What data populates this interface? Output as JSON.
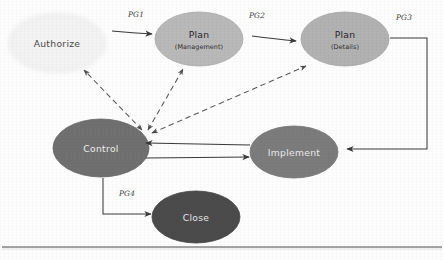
{
  "diagram": {
    "background_color": "#fdfdfd",
    "nodes": [
      {
        "id": "authorize",
        "label": "Authorize",
        "sublabel": "",
        "cx": 57,
        "cy": 43,
        "rx": 48,
        "ry": 29,
        "fill": "#f4f4f4",
        "text_color": "#4a4a4a"
      },
      {
        "id": "plan-management",
        "label": "Plan",
        "sublabel": "(Management)",
        "cx": 199,
        "cy": 39,
        "rx": 44,
        "ry": 27,
        "fill": "#b9b9b9",
        "text_color": "#2b2b2b"
      },
      {
        "id": "plan-details",
        "label": "Plan",
        "sublabel": "(Details)",
        "cx": 345,
        "cy": 39,
        "rx": 44,
        "ry": 27,
        "fill": "#b2b2b2",
        "text_color": "#2b2b2b"
      },
      {
        "id": "control",
        "label": "Control",
        "sublabel": "",
        "cx": 101,
        "cy": 148,
        "rx": 48,
        "ry": 29,
        "fill": "#6f6f6f",
        "text_color": "#f0f0f0"
      },
      {
        "id": "implement",
        "label": "Implement",
        "sublabel": "",
        "cx": 294,
        "cy": 152,
        "rx": 44,
        "ry": 26,
        "fill": "#7c7c7c",
        "text_color": "#ececec"
      },
      {
        "id": "close",
        "label": "Close",
        "sublabel": "",
        "cx": 196,
        "cy": 217,
        "rx": 44,
        "ry": 26,
        "fill": "#4b4b4b",
        "text_color": "#e8e8e8"
      }
    ],
    "edge_labels": [
      {
        "id": "pg1",
        "text": "PG1",
        "x": 136,
        "y": 17
      },
      {
        "id": "pg2",
        "text": "PG2",
        "x": 257,
        "y": 18
      },
      {
        "id": "pg3",
        "text": "PG3",
        "x": 404,
        "y": 20
      },
      {
        "id": "pg4",
        "text": "PG4",
        "x": 127,
        "y": 196
      }
    ],
    "edges": [
      {
        "id": "authorize-to-plan-management",
        "from": "authorize",
        "to": "plan-management",
        "style": "solid",
        "arrow": "forward",
        "label": "PG1"
      },
      {
        "id": "plan-management-to-plan-details",
        "from": "plan-management",
        "to": "plan-details",
        "style": "solid",
        "arrow": "forward",
        "label": "PG2"
      },
      {
        "id": "plan-details-to-implement",
        "from": "plan-details",
        "to": "implement",
        "style": "solid",
        "arrow": "forward",
        "label": "PG3"
      },
      {
        "id": "control-to-close",
        "from": "control",
        "to": "close",
        "style": "solid",
        "arrow": "forward",
        "label": "PG4"
      },
      {
        "id": "control-to-implement",
        "from": "control",
        "to": "implement",
        "style": "solid",
        "arrow": "forward",
        "label": ""
      },
      {
        "id": "implement-to-control",
        "from": "implement",
        "to": "control",
        "style": "solid",
        "arrow": "forward",
        "label": ""
      },
      {
        "id": "authorize-control-feedback",
        "from": "control",
        "to": "authorize",
        "style": "dashed",
        "arrow": "both",
        "label": ""
      },
      {
        "id": "plan-management-control-feedback",
        "from": "control",
        "to": "plan-management",
        "style": "dashed",
        "arrow": "both",
        "label": ""
      },
      {
        "id": "plan-details-control-feedback",
        "from": "control",
        "to": "plan-details",
        "style": "dashed",
        "arrow": "both",
        "label": ""
      }
    ],
    "footer_rule": {
      "y": 247,
      "color": "#4a4a4a"
    },
    "line_color": "#3b3b3b",
    "dashed_color": "#6b6b6b"
  }
}
